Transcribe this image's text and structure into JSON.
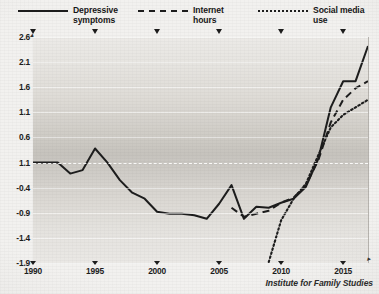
{
  "chart_data": {
    "type": "line",
    "title": "",
    "xlabel": "",
    "ylabel": "",
    "xlim": [
      1990,
      2017
    ],
    "ylim": [
      -1.9,
      2.6
    ],
    "grid": true,
    "legend_position": "top",
    "y_ticks": [
      "2.6",
      "2.1",
      "1.6",
      "1.1",
      "0.6",
      "1.1",
      "-0.4",
      "-0.9",
      "-1.4",
      "-1.9"
    ],
    "y_tick_values": [
      2.6,
      2.1,
      1.6,
      1.1,
      0.6,
      0.1,
      -0.4,
      -0.9,
      -1.4,
      -1.9
    ],
    "x_ticks": [
      "1990",
      "1995",
      "2000",
      "2005",
      "2010",
      "2015"
    ],
    "x_tick_values": [
      1990,
      1995,
      2000,
      2005,
      2010,
      2015
    ],
    "series": [
      {
        "name": "Depressive symptoms",
        "style": "solid",
        "color": "#1d1d1d",
        "x": [
          1990,
          1991,
          1992,
          1993,
          1994,
          1995,
          1996,
          1997,
          1998,
          1999,
          2000,
          2001,
          2002,
          2003,
          2004,
          2005,
          2006,
          2007,
          2008,
          2009,
          2010,
          2011,
          2012,
          2013,
          2014,
          2015,
          2016,
          2017
        ],
        "values": [
          0.1,
          0.1,
          0.1,
          -0.12,
          -0.05,
          0.38,
          0.1,
          -0.25,
          -0.5,
          -0.62,
          -0.88,
          -0.92,
          -0.92,
          -0.95,
          -1.02,
          -0.72,
          -0.35,
          -1.02,
          -0.78,
          -0.8,
          -0.7,
          -0.62,
          -0.38,
          0.18,
          1.2,
          1.72,
          1.72,
          2.42
        ]
      },
      {
        "name": "Internet hours",
        "style": "dashed",
        "color": "#1d1d1d",
        "x": [
          2006,
          2007,
          2008,
          2009,
          2010,
          2011,
          2012,
          2013,
          2014,
          2015,
          2016,
          2017
        ],
        "values": [
          -0.8,
          -0.98,
          -0.92,
          -0.86,
          -0.7,
          -0.6,
          -0.35,
          0.15,
          0.9,
          1.35,
          1.58,
          1.72
        ]
      },
      {
        "name": "Social media use",
        "style": "dotted",
        "color": "#1d1d1d",
        "x": [
          2009,
          2010,
          2011,
          2012,
          2013,
          2014,
          2015,
          2016,
          2017
        ],
        "values": [
          -1.88,
          -1.05,
          -0.62,
          -0.32,
          0.25,
          0.8,
          1.05,
          1.2,
          1.35
        ]
      }
    ]
  },
  "legend": {
    "items": [
      {
        "label": "Depressive\nsymptoms",
        "style": "solid"
      },
      {
        "label": "Internet\nhours",
        "style": "dashed"
      },
      {
        "label": "Social media use",
        "style": "dotted"
      }
    ]
  },
  "credit": {
    "text": "Institute for Family Studies"
  }
}
